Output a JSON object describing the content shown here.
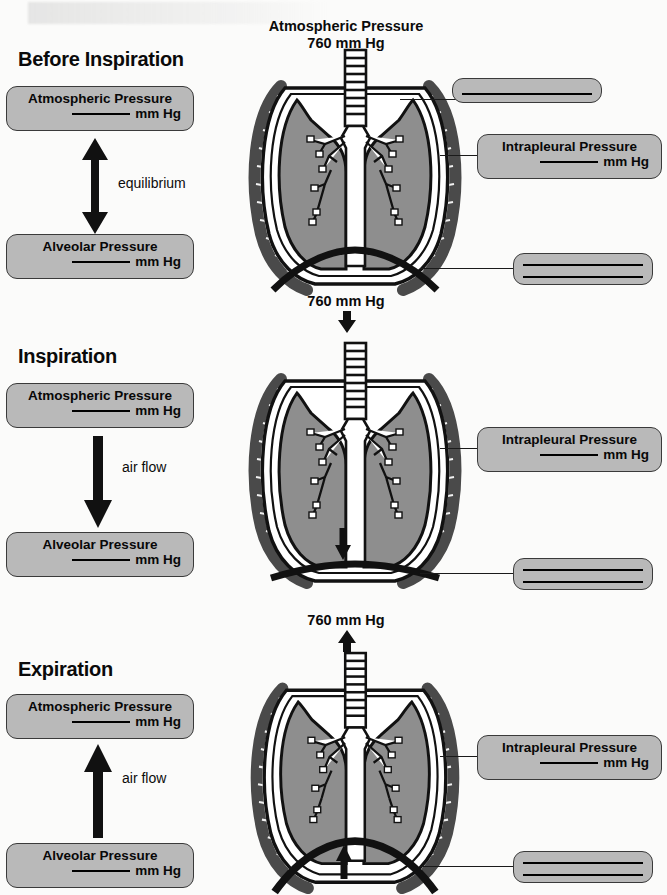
{
  "figure": {
    "title_top": "Atmospheric Pressure",
    "value_top": "760 mm Hg"
  },
  "blank_marker": "______",
  "units": "mm Hg",
  "sections": [
    {
      "id": "before-inspiration",
      "title": "Before Inspiration",
      "top_label_line1": "Atmospheric Pressure",
      "top_label_line2": "mm Hg",
      "bottom_label_line1": "Alveolar Pressure",
      "bottom_label_line2": "mm Hg",
      "flow_text": "equilibrium",
      "flow_arrow": "double-headed-vertical-arrow",
      "diagram_top_text_line1": "Atmospheric Pressure",
      "diagram_top_text_line2": "760 mm Hg",
      "diagram_arrow": "none",
      "callouts": [
        {
          "id": "upper-blank",
          "text": "",
          "lines": 1
        },
        {
          "id": "intrapleural",
          "text_line1": "Intrapleural Pressure",
          "text_line2": "mm Hg",
          "lines": 0
        },
        {
          "id": "lower-blank",
          "text": "",
          "lines": 2
        }
      ]
    },
    {
      "id": "inspiration",
      "title": "Inspiration",
      "top_label_line1": "Atmospheric Pressure",
      "top_label_line2": "mm Hg",
      "bottom_label_line1": "Alveolar Pressure",
      "bottom_label_line2": "mm Hg",
      "flow_text": "air flow",
      "flow_arrow": "down-arrow",
      "diagram_top_text_line1": "",
      "diagram_top_text_line2": "760 mm Hg",
      "diagram_arrow": "down-arrow",
      "callouts": [
        {
          "id": "intrapleural",
          "text_line1": "Intrapleural Pressure",
          "text_line2": "mm Hg",
          "lines": 0
        },
        {
          "id": "lower-blank",
          "text": "",
          "lines": 2
        }
      ]
    },
    {
      "id": "expiration",
      "title": "Expiration",
      "top_label_line1": "Atmospheric Pressure",
      "top_label_line2": "mm Hg",
      "bottom_label_line1": "Alveolar Pressure",
      "bottom_label_line2": "mm Hg",
      "flow_text": "air flow",
      "flow_arrow": "up-arrow",
      "diagram_top_text_line1": "",
      "diagram_top_text_line2": "760 mm Hg",
      "diagram_arrow": "up-arrow",
      "callouts": [
        {
          "id": "intrapleural",
          "text_line1": "Intrapleural Pressure",
          "text_line2": "mm Hg",
          "lines": 0
        },
        {
          "id": "lower-blank",
          "text": "",
          "lines": 2
        }
      ]
    }
  ],
  "colors": {
    "lung_fill": "#8e8e8e",
    "box_fill": "#b9b9b9",
    "outline": "#111111",
    "page_bg": "#fbfbfa",
    "ribcage": "#4a4a4a"
  }
}
